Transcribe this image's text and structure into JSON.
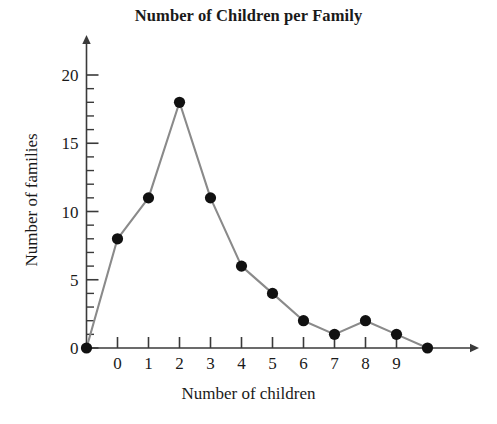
{
  "chart_data": {
    "type": "line",
    "title": "Number of Children per Family",
    "xlabel": "Number of children",
    "ylabel": "Number of families",
    "x": [
      -1,
      0,
      1,
      2,
      3,
      4,
      5,
      6,
      7,
      8,
      9,
      10
    ],
    "values": [
      0,
      8,
      11,
      18,
      11,
      6,
      4,
      2,
      1,
      2,
      1,
      0
    ],
    "series": [
      {
        "name": "Number of families",
        "values": [
          0,
          8,
          11,
          18,
          11,
          6,
          4,
          2,
          1,
          2,
          1,
          0
        ]
      }
    ],
    "xlim": [
      -1.6,
      10.9
    ],
    "ylim": [
      0,
      21.5
    ],
    "x_tick_labels": [
      "0",
      "1",
      "2",
      "3",
      "4",
      "5",
      "6",
      "7",
      "8",
      "9"
    ],
    "x_tick_values": [
      0,
      1,
      2,
      3,
      4,
      5,
      6,
      7,
      8,
      9
    ],
    "y_tick_labels": [
      "0",
      "5",
      "10",
      "15",
      "20"
    ],
    "y_tick_values": [
      0,
      5,
      10,
      15,
      20
    ],
    "y_minor_tick_step": 1,
    "grid": false,
    "legend": false,
    "marker": "filled-circle",
    "marker_color": "#111111",
    "line_color": "#8a8a8a",
    "axis_color": "#3a3a3a",
    "background_color": "#ffffff",
    "axis_arrows": [
      "x-right",
      "y-up"
    ]
  }
}
